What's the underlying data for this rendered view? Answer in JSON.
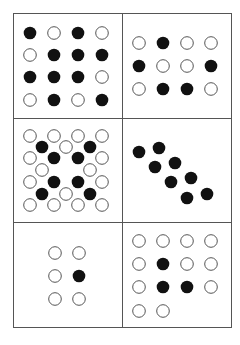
{
  "figure": {
    "colors": {
      "filled": "#111111",
      "empty_stroke": "#555555",
      "empty_fill": "#ffffff",
      "border": "#555555",
      "background": "#ffffff"
    },
    "panels": [
      {
        "id": "panel-1",
        "layout": "grid",
        "rows": [
          [
            "B",
            "W",
            "B",
            "W"
          ],
          [
            "W",
            "B",
            "B",
            "B"
          ],
          [
            "B",
            "B",
            "B",
            "W"
          ],
          [
            "W",
            "B",
            "W",
            "B"
          ]
        ]
      },
      {
        "id": "panel-2",
        "layout": "grid",
        "rows": [
          [
            "W",
            "B",
            "W",
            "W"
          ],
          [
            "B",
            "W",
            "W",
            "B"
          ],
          [
            "W",
            "B",
            "B",
            "W"
          ]
        ]
      },
      {
        "id": "panel-3",
        "layout": "staggered-lattice",
        "rows": [
          [
            "W",
            "W",
            "W",
            "W"
          ],
          [
            "B",
            "W",
            "B"
          ],
          [
            "W",
            "B",
            "B",
            "W"
          ],
          [
            "W",
            "",
            "W"
          ],
          [
            "W",
            "B",
            "B",
            "W"
          ],
          [
            "B",
            "W",
            "B"
          ],
          [
            "W",
            "W",
            "W",
            "W"
          ]
        ]
      },
      {
        "id": "panel-4",
        "layout": "diagonal-pairs",
        "pairs": 4,
        "dots": [
          "B",
          "B",
          "B",
          "B",
          "B",
          "B",
          "B",
          "B"
        ]
      },
      {
        "id": "panel-5",
        "layout": "grid",
        "rows": [
          [
            "W",
            "W"
          ],
          [
            "W",
            "B"
          ],
          [
            "W",
            "W"
          ]
        ]
      },
      {
        "id": "panel-6",
        "layout": "grid",
        "rows": [
          [
            "W",
            "W",
            "W",
            "W"
          ],
          [
            "W",
            "B",
            "W",
            "W"
          ],
          [
            "W",
            "B",
            "B",
            "W"
          ],
          [
            "W",
            "W"
          ]
        ]
      }
    ]
  }
}
